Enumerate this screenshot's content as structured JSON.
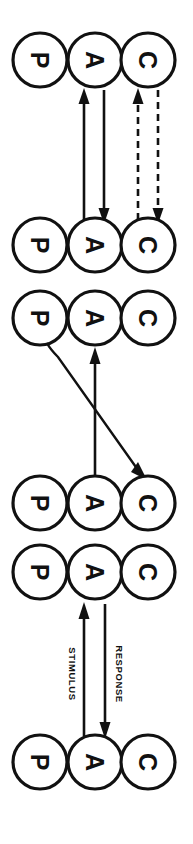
{
  "diagram": {
    "type": "flow-diagram",
    "canvas": {
      "width": 193,
      "height": 844,
      "background": "#ffffff"
    },
    "stroke_color": "#111111",
    "node_fill": "#ffffff",
    "node_radius": 27,
    "column_centers_x": [
      40,
      95,
      148
    ],
    "column_keys": [
      "P",
      "A",
      "C"
    ],
    "rows": [
      {
        "index": 1,
        "center_y": 60,
        "nodes": [
          {
            "column": "P",
            "label": "P",
            "cx": 40,
            "cy": 60
          },
          {
            "column": "A",
            "label": "A",
            "cx": 95,
            "cy": 60
          },
          {
            "column": "C",
            "label": "C",
            "cx": 148,
            "cy": 60
          }
        ]
      },
      {
        "index": 2,
        "center_y": 245,
        "nodes": [
          {
            "column": "P",
            "label": "P",
            "cx": 40,
            "cy": 245
          },
          {
            "column": "A",
            "label": "A",
            "cx": 95,
            "cy": 245
          },
          {
            "column": "C",
            "label": "C",
            "cx": 148,
            "cy": 245
          }
        ]
      },
      {
        "index": 3,
        "center_y": 318,
        "nodes": [
          {
            "column": "P",
            "label": "P",
            "cx": 40,
            "cy": 318
          },
          {
            "column": "A",
            "label": "A",
            "cx": 95,
            "cy": 318
          },
          {
            "column": "C",
            "label": "C",
            "cx": 148,
            "cy": 318
          }
        ]
      },
      {
        "index": 4,
        "center_y": 503,
        "nodes": [
          {
            "column": "P",
            "label": "P",
            "cx": 40,
            "cy": 503
          },
          {
            "column": "A",
            "label": "A",
            "cx": 95,
            "cy": 503
          },
          {
            "column": "C",
            "label": "C",
            "cx": 148,
            "cy": 503
          }
        ]
      },
      {
        "index": 5,
        "center_y": 572,
        "nodes": [
          {
            "column": "P",
            "label": "P",
            "cx": 40,
            "cy": 572
          },
          {
            "column": "A",
            "label": "A",
            "cx": 95,
            "cy": 572
          },
          {
            "column": "C",
            "label": "C",
            "cx": 148,
            "cy": 572
          }
        ]
      },
      {
        "index": 6,
        "center_y": 762,
        "nodes": [
          {
            "column": "P",
            "label": "P",
            "cx": 40,
            "cy": 762
          },
          {
            "column": "A",
            "label": "A",
            "cx": 95,
            "cy": 762
          },
          {
            "column": "C",
            "label": "C",
            "cx": 148,
            "cy": 762
          }
        ]
      }
    ],
    "edges": [
      {
        "id": "e1",
        "style": "solid",
        "from_row": 2,
        "to_row": 1,
        "x": 84,
        "y_start": 220,
        "y_end": 90,
        "direction": "up"
      },
      {
        "id": "e2",
        "style": "solid",
        "from_row": 1,
        "to_row": 2,
        "x": 104,
        "y_start": 90,
        "y_end": 222,
        "direction": "down"
      },
      {
        "id": "e3",
        "style": "dashed",
        "from_row": 2,
        "to_row": 1,
        "x": 138,
        "y_start": 220,
        "y_end": 90,
        "direction": "up"
      },
      {
        "id": "e4",
        "style": "dashed",
        "from_row": 1,
        "to_row": 2,
        "x": 158,
        "y_start": 90,
        "y_end": 222,
        "direction": "down"
      },
      {
        "id": "e5",
        "style": "solid",
        "from_row": 4,
        "to_row": 3,
        "x": 95,
        "y_start": 478,
        "y_end": 350,
        "direction": "up"
      },
      {
        "id": "e6",
        "style": "diagonal",
        "from_row": 3,
        "to_row": 4,
        "x_start": 47,
        "y_start": 344,
        "x_end": 145,
        "y_end": 477,
        "direction": "down-right"
      },
      {
        "id": "e7",
        "style": "solid",
        "from_row": 6,
        "to_row": 5,
        "x": 84,
        "y_start": 736,
        "y_end": 604,
        "direction": "up",
        "label": "STIMULUS"
      },
      {
        "id": "e8",
        "style": "solid",
        "from_row": 5,
        "to_row": 6,
        "x": 105,
        "y_start": 604,
        "y_end": 738,
        "direction": "down",
        "label": "RESPONSE"
      }
    ],
    "labels": [
      {
        "id": "stimulus-label",
        "text": "STIMULUS",
        "x": 72,
        "y": 672,
        "rotation": 90
      },
      {
        "id": "response-label",
        "text": "RESPONSE",
        "x": 119,
        "y": 672,
        "rotation": 90
      }
    ]
  }
}
